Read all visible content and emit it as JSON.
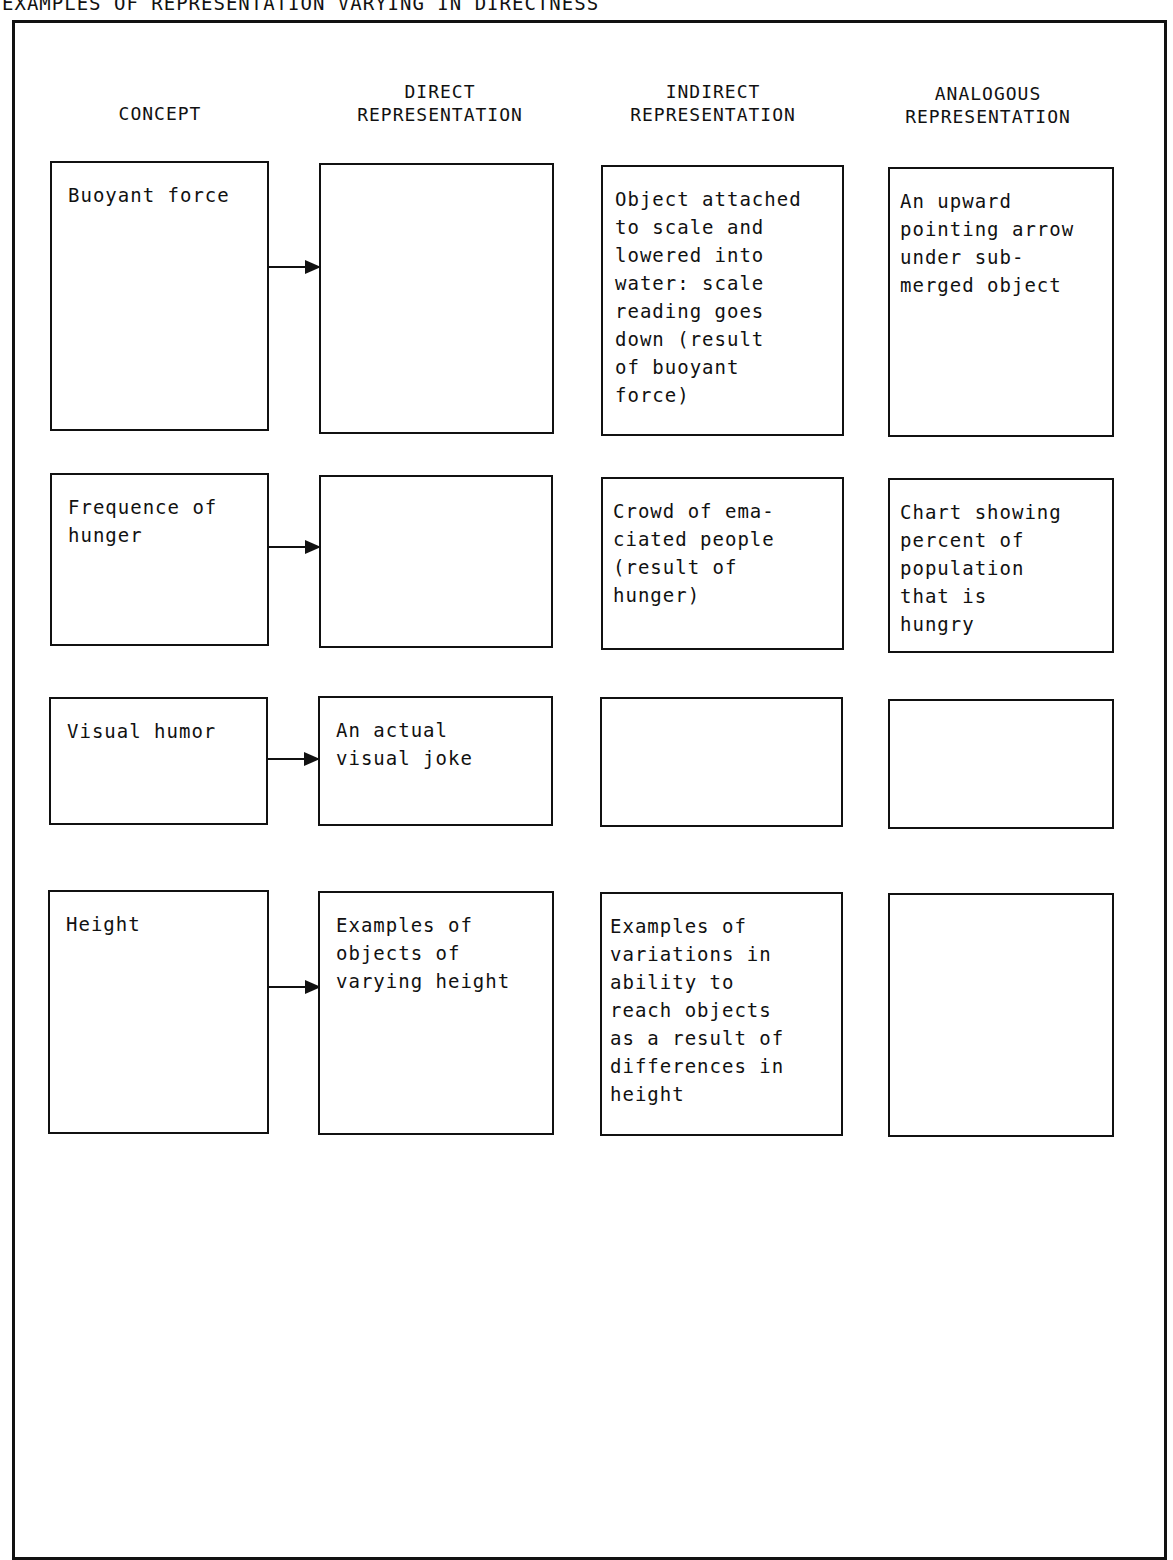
{
  "title": "EXAMPLES OF REPRESENTATION VARYING IN DIRECTNESS",
  "headers": {
    "concept": "CONCEPT",
    "direct": "DIRECT\nREPRESENTATION",
    "indirect": "INDIRECT\nREPRESENTATION",
    "analogous": "ANALOGOUS\nREPRESENTATION"
  },
  "rows": [
    {
      "concept": "Buoyant force",
      "direct": "",
      "indirect": "Object attached\nto scale and\nlowered into\nwater:  scale\nreading goes\ndown (result\nof buoyant\nforce)",
      "analogous": "An upward\npointing arrow\nunder sub-\nmerged object"
    },
    {
      "concept": "Frequence of\nhunger",
      "direct": "",
      "indirect": "Crowd of ema-\nciated people\n(result of\nhunger)",
      "analogous": "Chart showing\npercent of\npopulation\nthat is\nhungry"
    },
    {
      "concept": "Visual humor",
      "direct": "An actual\nvisual joke",
      "indirect": "",
      "analogous": ""
    },
    {
      "concept": "Height",
      "direct": "Examples of\nobjects of\nvarying height",
      "indirect": "Examples of\nvariations in\nability to\nreach objects\nas a result of\ndifferences in\nheight",
      "analogous": ""
    }
  ]
}
